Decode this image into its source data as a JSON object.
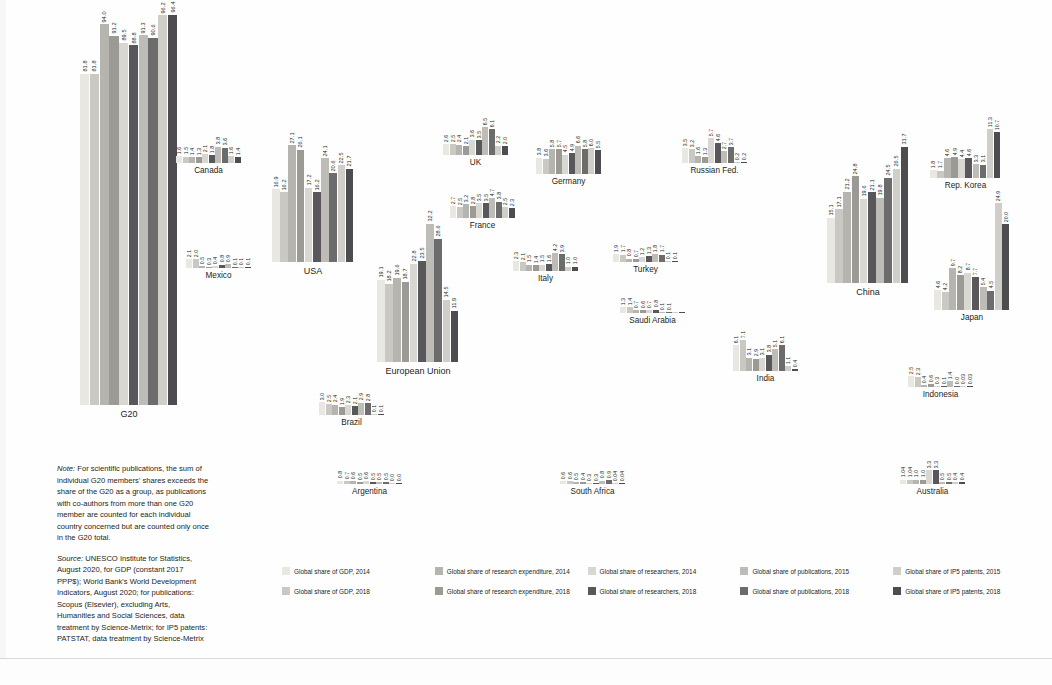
{
  "figure": {
    "series_order": [
      "gdp_2014",
      "gdp_2018",
      "research_expenditure_2014",
      "research_expenditure_2018",
      "researchers_2014",
      "researchers_2018",
      "publications_2015",
      "publications_2018",
      "ips_patents_2015",
      "ips_patents_2018"
    ],
    "colors": {
      "gdp_2014": "#e8e7e2",
      "gdp_2018": "#c9c8c2",
      "research_expenditure_2014": "#b5b4ae",
      "research_expenditure_2018": "#9b9a95",
      "researchers_2014": "#d8d7d1",
      "researchers_2018": "#58575a",
      "publications_2015": "#bdbcb6",
      "publications_2018": "#6d6c6c",
      "ips_patents_2015": "#cfcec8",
      "ips_patents_2018": "#4d4c4e"
    }
  },
  "legend": {
    "items": [
      {
        "label": "Global share of GDP, 2014",
        "key": "gdp_2014"
      },
      {
        "label": "Global share of research expenditure, 2014",
        "key": "research_expenditure_2014"
      },
      {
        "label": "Global share of researchers, 2014",
        "key": "researchers_2014"
      },
      {
        "label": "Global share of publications, 2015",
        "key": "publications_2015"
      },
      {
        "label": "Global share of IP5 patents, 2015",
        "key": "ips_patents_2015"
      },
      {
        "label": "Global share of GDP, 2018",
        "key": "gdp_2018"
      },
      {
        "label": "Global share of research expenditure, 2018",
        "key": "research_expenditure_2018"
      },
      {
        "label": "Global share of researchers, 2018",
        "key": "researchers_2018"
      },
      {
        "label": "Global share of publications, 2018",
        "key": "publications_2018"
      },
      {
        "label": "Global share of IP5 patents, 2018",
        "key": "ips_patents_2018"
      }
    ]
  },
  "notes": {
    "note_prefix": "Note:",
    "note_text": " For scientific publications, the sum of individual G20 members' shares exceeds the share of the G20 as a group, as publications with co-authors from more than one G20 member are counted for each individual country concerned but are counted only once in the G20 total.",
    "source_prefix": "Source:",
    "source_text": " UNESCO Institute for Statistics, August 2020, for GDP (constant 2017 PPP$); World Bank's World Development Indicators, August 2020; for publications: Scopus (Elsevier), excluding Arts, Humanities and Social Sciences, data treatment by Science-Metrix; for IP5 patents: PATSTAT, data treatment by Science-Metrix"
  },
  "chart_data": {
    "type": "bar",
    "title": "",
    "xlabel": "",
    "ylabel": "",
    "ylim": [
      0,
      100
    ],
    "grid": false,
    "legend_position": "bottom",
    "series": [
      {
        "name": "Global share of GDP, 2014",
        "key": "gdp_2014"
      },
      {
        "name": "Global share of GDP, 2018",
        "key": "gdp_2018"
      },
      {
        "name": "Global share of research expenditure, 2014",
        "key": "research_expenditure_2014"
      },
      {
        "name": "Global share of research expenditure, 2018",
        "key": "research_expenditure_2018"
      },
      {
        "name": "Global share of researchers, 2014",
        "key": "researchers_2014"
      },
      {
        "name": "Global share of researchers, 2018",
        "key": "researchers_2018"
      },
      {
        "name": "Global share of publications, 2015",
        "key": "publications_2015"
      },
      {
        "name": "Global share of publications, 2018",
        "key": "publications_2018"
      },
      {
        "name": "Global share of IP5 patents, 2015",
        "key": "ips_patents_2015"
      },
      {
        "name": "Global share of IP5 patents, 2018",
        "key": "ips_patents_2018"
      }
    ],
    "categories": [
      "G20",
      "Canada",
      "Mexico",
      "USA",
      "European Union",
      "Brazil",
      "Argentina",
      "UK",
      "France",
      "Italy",
      "Germany",
      "Turkey",
      "South Africa",
      "Russian Fed.",
      "Saudi Arabia",
      "India",
      "China",
      "Japan",
      "Rep. Korea",
      "Indonesia",
      "Australia"
    ],
    "clusters": [
      {
        "name": "G20",
        "values": [
          81.8,
          81.8,
          94.0,
          91.2,
          89.5,
          88.8,
          91.3,
          90.6,
          96.2,
          96.4
        ],
        "labels": [
          "81.8",
          "81.8",
          "94.0",
          "91.2",
          "89.5",
          "88.8",
          "91.3",
          "90.6",
          "96.2",
          "96.4"
        ]
      },
      {
        "name": "Canada",
        "values": [
          1.6,
          1.5,
          1.4,
          1.3,
          2.1,
          1.8,
          3.8,
          3.6,
          1.6,
          1.4
        ],
        "labels": [
          "1.6",
          "1.5",
          "1.4",
          "1.3",
          "2.1",
          "1.8",
          "3.8",
          "3.6",
          "1.6",
          "1.4"
        ]
      },
      {
        "name": "Mexico",
        "values": [
          2.1,
          2.0,
          0.5,
          0.3,
          0.4,
          0.8,
          0.9,
          0.1,
          0.1,
          0.1
        ],
        "labels": [
          "2.1",
          "2.0",
          "0.5",
          "0.3",
          "0.4",
          "0.8",
          "0.9",
          "0.1",
          "0.1",
          "0.1"
        ]
      },
      {
        "name": "USA",
        "values": [
          16.9,
          16.2,
          27.1,
          26.1,
          17.2,
          16.2,
          24.1,
          20.6,
          22.5,
          21.7
        ],
        "labels": [
          "16.9",
          "16.2",
          "27.1",
          "26.1",
          "17.2",
          "16.2",
          "24.1",
          "20.6",
          "22.5",
          "21.7"
        ]
      },
      {
        "name": "European Union",
        "values": [
          19.1,
          18.2,
          19.6,
          18.7,
          22.8,
          23.5,
          32.2,
          28.6,
          14.5,
          11.9
        ],
        "labels": [
          "19.1",
          "18.2",
          "19.6",
          "18.7",
          "22.8",
          "23.5",
          "32.2",
          "28.6",
          "14.5",
          "11.9"
        ]
      },
      {
        "name": "Brazil",
        "values": [
          3.0,
          2.5,
          2.4,
          1.9,
          2.3,
          2.1,
          2.9,
          2.8,
          0.1,
          0.1
        ],
        "labels": [
          "3.0",
          "2.5",
          "2.4",
          "1.9",
          "2.3",
          "2.1",
          "2.9",
          "2.8",
          "0.1",
          "0.1"
        ]
      },
      {
        "name": "Argentina",
        "values": [
          0.8,
          0.7,
          0.6,
          0.5,
          0.6,
          0.5,
          0.5,
          0.5,
          0.0,
          0.0
        ],
        "labels": [
          "0.8",
          "0.7",
          "0.6",
          "0.5",
          "0.6",
          "0.5",
          "0.5",
          "0.5",
          "0.0",
          "0.0"
        ]
      },
      {
        "name": "UK",
        "values": [
          2.6,
          2.5,
          2.4,
          2.1,
          3.6,
          3.5,
          6.5,
          6.1,
          2.2,
          2.0
        ],
        "labels": [
          "2.6",
          "2.5",
          "2.4",
          "2.1",
          "3.6",
          "3.5",
          "6.5",
          "6.1",
          "2.2",
          "2.0"
        ]
      },
      {
        "name": "France",
        "values": [
          2.7,
          2.5,
          3.2,
          2.8,
          3.5,
          3.5,
          4.7,
          3.8,
          2.5,
          2.3
        ],
        "labels": [
          "2.7",
          "2.5",
          "3.2",
          "2.8",
          "3.5",
          "3.5",
          "4.7",
          "3.8",
          "2.5",
          "2.3"
        ]
      },
      {
        "name": "Italy",
        "values": [
          2.3,
          2.1,
          1.5,
          1.4,
          1.5,
          1.6,
          4.2,
          3.9,
          1.0,
          1.0
        ],
        "labels": [
          "2.3",
          "2.1",
          "1.5",
          "1.4",
          "1.5",
          "1.6",
          "4.2",
          "3.9",
          "1.0",
          "1.0"
        ]
      },
      {
        "name": "Germany",
        "values": [
          3.8,
          3.6,
          5.8,
          5.7,
          4.5,
          4.9,
          6.6,
          5.8,
          6.0,
          5.5
        ],
        "labels": [
          "3.8",
          "3.6",
          "5.8",
          "5.7",
          "4.5",
          "4.9",
          "6.6",
          "5.8",
          "6.0",
          "5.5"
        ]
      },
      {
        "name": "Turkey",
        "values": [
          1.9,
          1.7,
          0.8,
          0.7,
          1.2,
          1.3,
          1.8,
          1.7,
          0.1,
          0.1
        ],
        "labels": [
          "1.9",
          "1.7",
          "0.8",
          "0.7",
          "1.2",
          "1.3",
          "1.8",
          "1.7",
          "0.1",
          "0.1"
        ]
      },
      {
        "name": "South Africa",
        "values": [
          0.6,
          0.6,
          0.5,
          0.4,
          0.3,
          0.3,
          0.8,
          0.9,
          0.04,
          0.04
        ],
        "labels": [
          "0.6",
          "0.6",
          "0.5",
          "0.4",
          "0.3",
          "0.3",
          "0.8",
          "0.9",
          "0.04",
          "0.04"
        ]
      },
      {
        "name": "Russian Fed.",
        "values": [
          3.5,
          3.2,
          1.6,
          1.3,
          5.7,
          4.6,
          2.7,
          3.7,
          0.2,
          0.2
        ],
        "labels": [
          "3.5",
          "3.2",
          "1.6",
          "1.3",
          "5.7",
          "4.6",
          "2.7",
          "3.7",
          "0.2",
          "0.2"
        ]
      },
      {
        "name": "Saudi Arabia",
        "values": [
          1.3,
          1.4,
          0.7,
          0.6,
          0.7,
          0.8,
          0.1,
          0.1,
          0.04,
          0.04
        ],
        "labels": [
          "1.3",
          "1.4",
          "0.7",
          "0.6",
          "0.7",
          "0.8",
          "0.1",
          "0.1",
          "",
          ""
        ]
      },
      {
        "name": "India",
        "values": [
          6.1,
          7.1,
          3.1,
          2.9,
          3.1,
          3.8,
          5.1,
          6.1,
          1.1,
          0.4
        ],
        "labels": [
          "6.1",
          "7.1",
          "3.1",
          "2.9",
          "3.1",
          "3.8",
          "5.1",
          "6.1",
          "1.1",
          "0.4"
        ]
      },
      {
        "name": "China",
        "values": [
          15.1,
          17.1,
          21.2,
          24.8,
          19.6,
          21.1,
          19.8,
          24.5,
          26.5,
          31.7
        ],
        "labels": [
          "15.1",
          "17.1",
          "21.2",
          "24.8",
          "19.6",
          "21.1",
          "19.8",
          "24.5",
          "26.5",
          "31.7"
        ]
      },
      {
        "name": "Japan",
        "values": [
          4.6,
          4.2,
          9.7,
          8.2,
          8.7,
          7.7,
          5.4,
          4.5,
          24.9,
          20.0
        ],
        "labels": [
          "4.6",
          "4.2",
          "9.7",
          "8.2",
          "8.7",
          "7.7",
          "5.4",
          "4.5",
          "24.9",
          "20.0"
        ]
      },
      {
        "name": "Rep. Korea",
        "values": [
          1.8,
          1.7,
          4.6,
          4.9,
          4.4,
          4.6,
          3.3,
          3.1,
          11.3,
          10.7
        ],
        "labels": [
          "1.8",
          "1.7",
          "4.6",
          "4.9",
          "4.4",
          "4.6",
          "3.3",
          "3.1",
          "11.3",
          "10.7"
        ]
      },
      {
        "name": "Indonesia",
        "values": [
          2.5,
          2.3,
          0.4,
          0.6,
          0.3,
          0.1,
          1.4,
          0.0,
          0.03,
          0.03
        ],
        "labels": [
          "2.5",
          "2.3",
          "0.4",
          "0.6",
          "0.3",
          "0.1",
          "1.4",
          "0.0",
          "0.03",
          "0.03"
        ]
      },
      {
        "name": "Australia",
        "values": [
          1.04,
          1.04,
          1.0,
          1.0,
          3.3,
          3.3,
          0.5,
          0.5,
          0.4,
          0.4
        ],
        "labels": [
          "1.04",
          "1.04",
          "1.0",
          "1.0",
          "3.3",
          "3.3",
          "0.5",
          "0.5",
          "0.4",
          "0.4"
        ]
      }
    ]
  }
}
